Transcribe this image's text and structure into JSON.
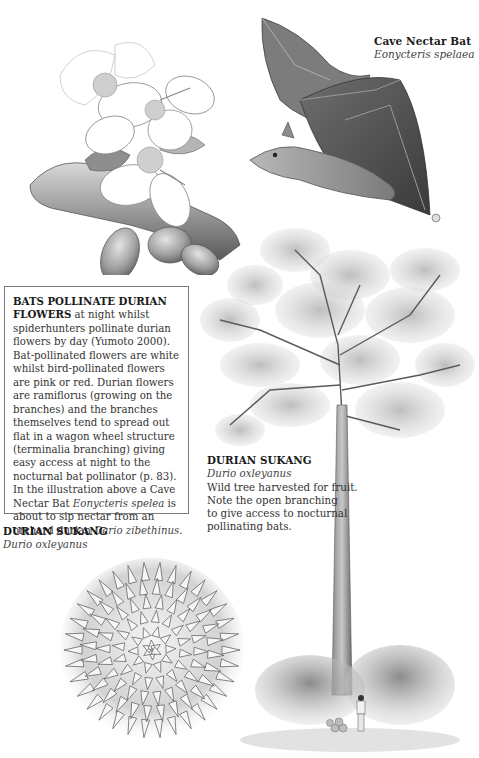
{
  "bat_caption": {
    "title": "Cave Nectar Bat",
    "latin": "Eonycteris spelaea"
  },
  "info_box": {
    "heading": "BATS POLLINATE DURIAN FLOWERS",
    "text_1": " at night whilst spiderhunters pollinate durian flowers by day (Yumoto 2000). Bat-pollinated flowers are white whilst bird-pollinated flowers are pink or red. Durian flowers are ramiflorus (growing on the branches) and the branches themselves tend to spread out flat in a wagon wheel structure (terminalia branching) giving easy access at night to the nocturnal bat pollinator (p. 83).",
    "text_2": "In the illustration above a Cave Nectar Bat ",
    "latin_1": "Eonycteris spelea",
    "text_3": " is about to sip nectar from an orchard durian ",
    "latin_2": "Dario zibethinus",
    "text_4": "."
  },
  "tree_caption": {
    "title": "DURIAN SUKANG",
    "latin": "Durio oxleyanus",
    "body_lines": [
      "Wild tree harvested for fruit.",
      "Note the open branching",
      "to give access to nocturnal",
      "pollinating bats."
    ]
  },
  "fruit_caption": {
    "title": "DURIAN SUKANG",
    "latin": "Durio oxleyanus"
  },
  "illustrations": {
    "flower": "durian-flower-branch-illustration",
    "bat": "cave-nectar-bat-illustration",
    "tree": "durian-tree-illustration",
    "fruit": "spiky-durian-fruit-illustration"
  },
  "colors": {
    "background": "#ffffff",
    "text": "#333333",
    "box_border": "#7a7a7a"
  }
}
